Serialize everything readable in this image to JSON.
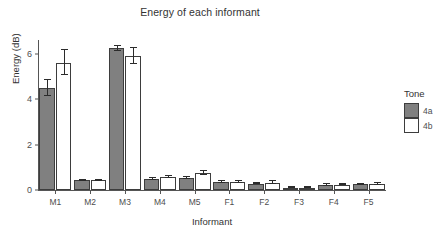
{
  "chart_data": {
    "type": "bar",
    "title": "Energy of each informant",
    "xlabel": "Informant",
    "ylabel": "Energy (dB)",
    "categories": [
      "M1",
      "M2",
      "M3",
      "M4",
      "M5",
      "F1",
      "F2",
      "F3",
      "F4",
      "F5"
    ],
    "ylim": [
      0,
      6.7
    ],
    "yticks": [
      0,
      2,
      4,
      6
    ],
    "ytick_labels": [
      "0",
      "2",
      "4",
      "6"
    ],
    "grid": false,
    "legend": {
      "title": "Tone",
      "position": "right",
      "entries": [
        {
          "label": "4a",
          "color": "#808080"
        },
        {
          "label": "4b",
          "color": "#ffffff"
        }
      ]
    },
    "series": [
      {
        "name": "4a",
        "color": "#808080",
        "values": [
          4.5,
          0.42,
          6.25,
          0.5,
          0.52,
          0.35,
          0.28,
          0.1,
          0.22,
          0.25
        ],
        "errors": [
          0.35,
          0.04,
          0.12,
          0.05,
          0.05,
          0.04,
          0.03,
          0.02,
          0.03,
          0.03
        ]
      },
      {
        "name": "4b",
        "color": "#ffffff",
        "values": [
          5.6,
          0.42,
          5.9,
          0.57,
          0.75,
          0.37,
          0.33,
          0.11,
          0.24,
          0.28
        ],
        "errors": [
          0.55,
          0.04,
          0.35,
          0.06,
          0.08,
          0.04,
          0.05,
          0.02,
          0.04,
          0.04
        ]
      }
    ]
  }
}
